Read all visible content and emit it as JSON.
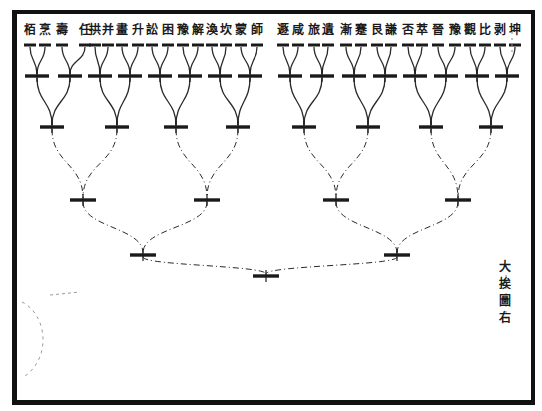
{
  "diagram": {
    "type": "bracket-tree",
    "caption": [
      "大",
      "挨",
      "圖",
      "右"
    ],
    "colors": {
      "ink": "#1a1a1a",
      "paper": "#ffffff",
      "border": "#111111"
    },
    "leaves": [
      {
        "label": "栢",
        "x": 30
      },
      {
        "label": "烹",
        "x": 45
      },
      {
        "label": "壽",
        "x": 62
      },
      {
        "label": "任",
        "x": 85
      },
      {
        "label": "拱",
        "x": 95
      },
      {
        "label": "并",
        "x": 108
      },
      {
        "label": "畫",
        "x": 122
      },
      {
        "label": "升",
        "x": 138
      },
      {
        "label": "訟",
        "x": 152
      },
      {
        "label": "困",
        "x": 168
      },
      {
        "label": "豫",
        "x": 183
      },
      {
        "label": "解",
        "x": 198
      },
      {
        "label": "渙",
        "x": 212
      },
      {
        "label": "坎",
        "x": 226
      },
      {
        "label": "蒙",
        "x": 241
      },
      {
        "label": "師",
        "x": 257
      },
      {
        "label": "遯",
        "x": 283
      },
      {
        "label": "咸",
        "x": 298
      },
      {
        "label": "旅",
        "x": 314
      },
      {
        "label": "遺",
        "x": 328
      },
      {
        "label": "漸",
        "x": 346
      },
      {
        "label": "蹇",
        "x": 361
      },
      {
        "label": "艮",
        "x": 377
      },
      {
        "label": "謙",
        "x": 391
      },
      {
        "label": "否",
        "x": 408
      },
      {
        "label": "萃",
        "x": 422
      },
      {
        "label": "晉",
        "x": 438
      },
      {
        "label": "豫",
        "x": 455
      },
      {
        "label": "觀",
        "x": 470
      },
      {
        "label": "比",
        "x": 485
      },
      {
        "label": "剥",
        "x": 500
      },
      {
        "label": "坤",
        "x": 515
      }
    ],
    "levels": [
      {
        "y": 76,
        "nodes": [
          37,
          70,
          100,
          130,
          160,
          190,
          220,
          250,
          290,
          322,
          354,
          385,
          415,
          446,
          477,
          507
        ]
      },
      {
        "y": 127,
        "nodes": [
          52,
          117,
          176,
          238,
          304,
          368,
          431,
          491
        ]
      },
      {
        "y": 200,
        "nodes": [
          83,
          207,
          336,
          458
        ]
      },
      {
        "y": 255,
        "nodes": [
          143,
          397
        ]
      },
      {
        "y": 276,
        "nodes": [
          266
        ]
      }
    ],
    "leaf_bar_y": 45
  }
}
